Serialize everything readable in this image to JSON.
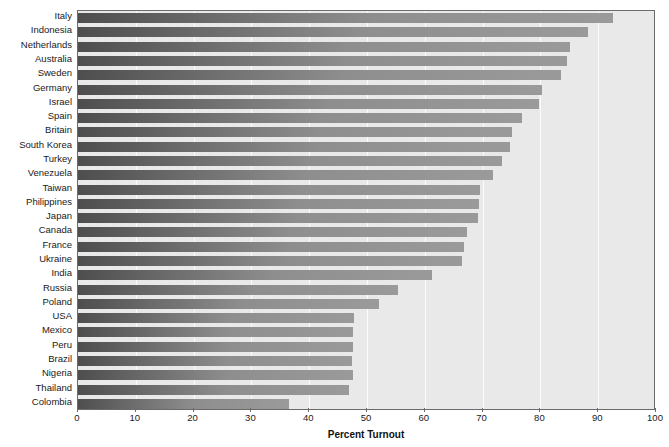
{
  "chart_data": {
    "type": "bar",
    "orientation": "horizontal",
    "title": "",
    "xlabel": "Percent Turnout",
    "ylabel": "",
    "xlim": [
      0,
      100
    ],
    "xticks": [
      0,
      10,
      20,
      30,
      40,
      50,
      60,
      70,
      80,
      90,
      100
    ],
    "grid": true,
    "legend": false,
    "categories": [
      "Italy",
      "Indonesia",
      "Netherlands",
      "Australia",
      "Sweden",
      "Germany",
      "Israel",
      "Spain",
      "Britain",
      "South Korea",
      "Turkey",
      "Venezuela",
      "Taiwan",
      "Philippines",
      "Japan",
      "Canada",
      "France",
      "Ukraine",
      "India",
      "Russia",
      "Poland",
      "USA",
      "Mexico",
      "Peru",
      "Brazil",
      "Nigeria",
      "Thailand",
      "Colombia"
    ],
    "values": [
      92.5,
      88.3,
      85.1,
      84.6,
      83.6,
      80.3,
      79.8,
      76.8,
      75.1,
      74.7,
      73.4,
      71.8,
      69.6,
      69.4,
      69.2,
      67.3,
      66.8,
      66.4,
      61.2,
      55.4,
      52.1,
      47.8,
      47.6,
      47.6,
      47.4,
      47.6,
      46.9,
      36.5
    ]
  },
  "colors": {
    "plot_background": "#e9e9e9",
    "bar_fill_dark": "#4e4e4e",
    "bar_fill_light": "#9a9a9a",
    "gridline": "#fbfbfb",
    "frame": "#6b6b6b",
    "text": "#1a1a1a"
  }
}
